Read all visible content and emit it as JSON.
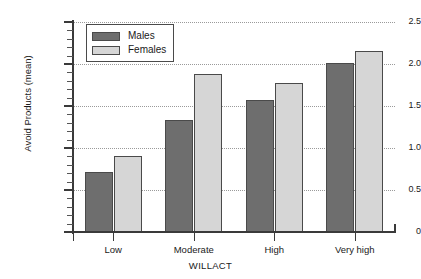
{
  "chart_data": {
    "type": "bar",
    "title": "",
    "xlabel": "WILLACT",
    "ylabel": "Avoid Products (mean)",
    "categories": [
      "Low",
      "Moderate",
      "High",
      "Very high"
    ],
    "series": [
      {
        "name": "Males",
        "color": "#6e6e6e",
        "values": [
          0.72,
          1.33,
          1.57,
          2.01
        ]
      },
      {
        "name": "Females",
        "color": "#d6d6d6",
        "values": [
          0.91,
          1.88,
          1.77,
          2.15
        ]
      }
    ],
    "ylim": [
      0,
      2.5
    ],
    "ytick_labels": [
      "0",
      "0.5",
      "1.0",
      "1.5",
      "2.0",
      "2.5"
    ],
    "ytick_values": [
      0,
      0.5,
      1.0,
      1.5,
      2.0,
      2.5
    ],
    "yminor_step": 0.1,
    "grid": "horizontal-dotted",
    "legend_position": "top-left-inside",
    "axis_color": "#3a3a3a",
    "grid_color": "#9a9a9a",
    "background": "#ffffff"
  },
  "legend": {
    "entries": [
      {
        "label": "Males"
      },
      {
        "label": "Females"
      }
    ]
  }
}
